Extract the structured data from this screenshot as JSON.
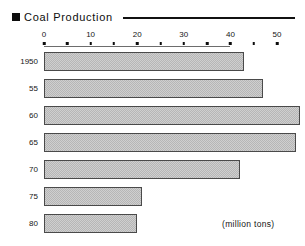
{
  "title": {
    "bullet_icon": "filled-square-bullet",
    "text": "Coal Production"
  },
  "unit_note": "(million tons)",
  "chart_data": {
    "type": "bar",
    "orientation": "horizontal",
    "title": "Coal Production",
    "xlabel": "",
    "ylabel": "",
    "unit": "million tons",
    "categories": [
      "1950",
      "55",
      "60",
      "65",
      "70",
      "75",
      "80"
    ],
    "values": [
      43,
      47,
      55,
      54,
      42,
      21,
      20
    ],
    "xlim": [
      0,
      50
    ],
    "xticks": [
      0,
      10,
      20,
      30,
      40,
      50
    ],
    "xtick_labels": [
      "0",
      "10",
      "20",
      "30",
      "40",
      "50"
    ],
    "minor_tick_dots": [
      0,
      5,
      10,
      15,
      20,
      25,
      30,
      35,
      40,
      45,
      50
    ],
    "grid": false,
    "legend": "none",
    "bar_fill": "#cfcfcf",
    "bar_pattern": "checkered-dither",
    "bar_border": "#4a4a4a"
  }
}
